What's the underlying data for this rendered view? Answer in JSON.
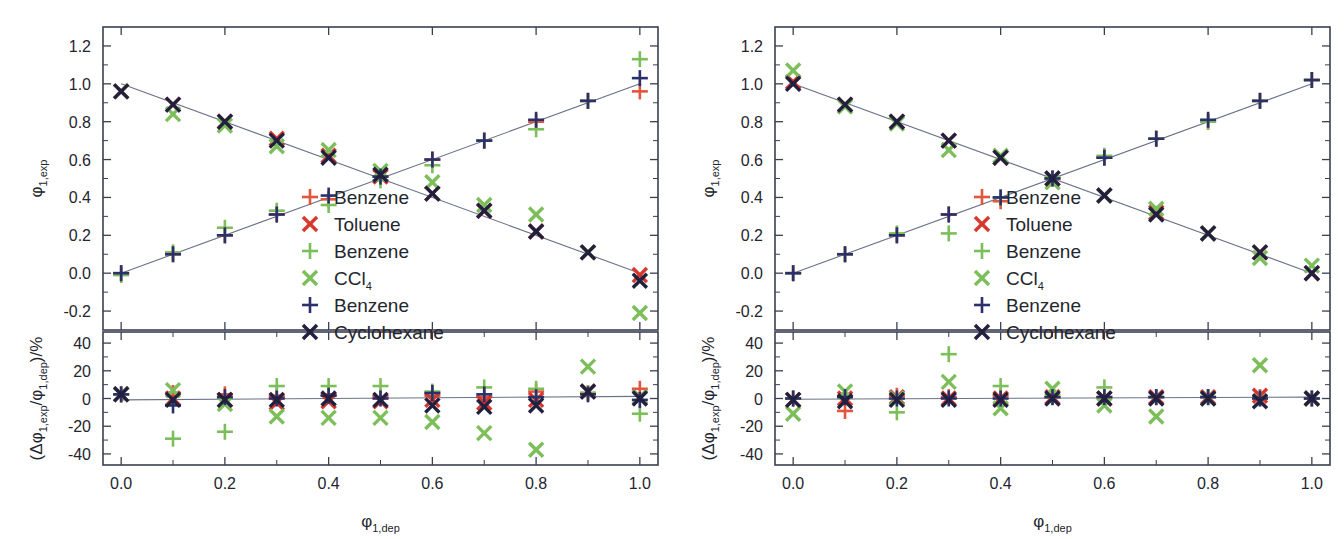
{
  "figure": {
    "panel_count": 2,
    "background": "#ffffff"
  },
  "axes": {
    "x_label_main": "φ",
    "x_label_sub": "1,dep",
    "y_top_label_main": "φ",
    "y_top_label_sub": "1,exp",
    "y_bottom_label": "(Δφ",
    "y_bottom_sub1": "1,exp",
    "y_bottom_mid": "/φ",
    "y_bottom_sub2": "1,dep",
    "y_bottom_end": ")/%",
    "x_ticks": [
      "0.0",
      "0.2",
      "0.4",
      "0.6",
      "0.8",
      "1.0"
    ],
    "y_top_ticks": [
      "1.2",
      "1.0",
      "0.8",
      "0.6",
      "0.4",
      "0.2",
      "0.0",
      "-0.2"
    ],
    "y_bottom_ticks": [
      "40",
      "20",
      "0",
      "-20",
      "-40"
    ]
  },
  "legend": {
    "entries": [
      {
        "label": "Benzene",
        "marker": "plus",
        "color": "#e2563c",
        "name": "legend-benzene-red"
      },
      {
        "label": "Toluene",
        "marker": "cross",
        "color": "#d8372b",
        "name": "legend-toluene"
      },
      {
        "label": "Benzene",
        "marker": "plus",
        "color": "#7cbf5a",
        "name": "legend-benzene-green"
      },
      {
        "label": "CCl",
        "sub": "4",
        "marker": "cross",
        "color": "#7cbf5a",
        "name": "legend-ccl4"
      },
      {
        "label": "Benzene",
        "marker": "plus",
        "color": "#2b2f6b",
        "name": "legend-benzene-navy"
      },
      {
        "label": "Cyclohexane",
        "marker": "cross",
        "color": "#21203f",
        "name": "legend-cyclohexane"
      }
    ]
  },
  "colors": {
    "red_plus": "#e2563c",
    "red_cross": "#d8372b",
    "green": "#7cbf5a",
    "navy_plus": "#2b2f6b",
    "navy_cross": "#21203f",
    "frame": "#3a3f52",
    "fitline": "#6a7188"
  },
  "chart_data": {
    "type": "scatter",
    "title": "",
    "xlabel": "φ 1,dep",
    "ylabel_top": "φ 1,exp",
    "ylabel_bottom": "(Δφ 1,exp / φ 1,dep) / %",
    "xlim": [
      -0.035,
      1.035
    ],
    "ylim_top": [
      -0.3,
      1.3
    ],
    "ylim_bottom": [
      -48,
      48
    ],
    "grid": false,
    "legend_position": "center-right-inside",
    "panels": [
      {
        "name": "left-panel",
        "x": [
          0.0,
          0.1,
          0.2,
          0.3,
          0.4,
          0.5,
          0.6,
          0.7,
          0.8,
          0.9,
          1.0
        ],
        "top": {
          "fit_lines": [
            {
              "name": "rising",
              "from": [
                0.0,
                0.0
              ],
              "to": [
                1.0,
                1.0
              ]
            },
            {
              "name": "falling",
              "from": [
                0.0,
                1.0
              ],
              "to": [
                1.0,
                0.0
              ]
            }
          ],
          "series": [
            {
              "name": "Benzene-red-plus",
              "marker": "plus",
              "color": "#e2563c",
              "values": [
                0.0,
                0.1,
                0.2,
                0.31,
                0.39,
                0.51,
                0.6,
                0.7,
                0.8,
                0.91,
                0.96
              ]
            },
            {
              "name": "Toluene-red-cross",
              "marker": "cross",
              "color": "#d8372b",
              "values": [
                0.96,
                0.89,
                0.8,
                0.71,
                0.62,
                0.51,
                0.42,
                0.33,
                0.22,
                0.11,
                -0.01
              ]
            },
            {
              "name": "Benzene-green-plus",
              "marker": "plus",
              "color": "#7cbf5a",
              "values": [
                -0.01,
                0.11,
                0.24,
                0.33,
                0.36,
                0.49,
                0.57,
                0.7,
                0.76,
                0.91,
                1.13
              ]
            },
            {
              "name": "CCl4-green-cross",
              "marker": "cross",
              "color": "#7cbf5a",
              "values": [
                0.96,
                0.84,
                0.78,
                0.67,
                0.65,
                0.54,
                0.48,
                0.36,
                0.31,
                0.11,
                -0.21
              ]
            },
            {
              "name": "Benzene-navy-plus",
              "marker": "plus",
              "color": "#2b2f6b",
              "values": [
                0.0,
                0.1,
                0.2,
                0.31,
                0.41,
                0.51,
                0.6,
                0.7,
                0.81,
                0.91,
                1.03
              ]
            },
            {
              "name": "Cyclohexane-navy-cross",
              "marker": "cross",
              "color": "#21203f",
              "values": [
                0.96,
                0.89,
                0.8,
                0.7,
                0.61,
                0.52,
                0.42,
                0.33,
                0.22,
                0.11,
                -0.04
              ]
            }
          ]
        },
        "bottom": {
          "baseline": {
            "from": [
              0.0,
              -1.0
            ],
            "to": [
              1.0,
              1.5
            ]
          },
          "series": [
            {
              "name": "Benzene-red-plus",
              "marker": "plus",
              "color": "#e2563c",
              "values": [
                3.0,
                4.0,
                3.0,
                2.0,
                3.0,
                1.0,
                2.0,
                1.0,
                5.0,
                4.0,
                7.0
              ]
            },
            {
              "name": "Toluene-red-cross",
              "marker": "cross",
              "color": "#d8372b",
              "values": [
                3.0,
                0.0,
                -1.0,
                -3.0,
                -2.0,
                -2.0,
                -1.0,
                -3.0,
                -1.0,
                5.0,
                1.0
              ]
            },
            {
              "name": "Benzene-green-plus",
              "marker": "plus",
              "color": "#7cbf5a",
              "values": [
                3.0,
                -29.0,
                -24.0,
                9.0,
                9.0,
                9.0,
                5.0,
                8.0,
                7.0,
                4.0,
                -11.0
              ]
            },
            {
              "name": "CCl4-green-cross",
              "marker": "cross",
              "color": "#7cbf5a",
              "values": [
                3.0,
                6.0,
                -4.0,
                -13.0,
                -14.0,
                -14.0,
                -17.0,
                -25.0,
                -37.0,
                23.0,
                1.0
              ]
            },
            {
              "name": "Benzene-navy-plus",
              "marker": "plus",
              "color": "#2b2f6b",
              "values": [
                3.0,
                -5.0,
                1.0,
                0.0,
                2.0,
                0.0,
                4.0,
                3.0,
                1.0,
                3.0,
                -1.0
              ]
            },
            {
              "name": "Cyclohexane-navy-cross",
              "marker": "cross",
              "color": "#21203f",
              "values": [
                3.0,
                -1.0,
                -1.0,
                -1.0,
                0.0,
                -1.0,
                -5.0,
                -6.0,
                -5.0,
                5.0,
                0.0
              ]
            }
          ]
        }
      },
      {
        "name": "right-panel",
        "x": [
          0.0,
          0.1,
          0.2,
          0.3,
          0.4,
          0.5,
          0.6,
          0.7,
          0.8,
          0.9,
          1.0
        ],
        "top": {
          "fit_lines": [
            {
              "name": "rising",
              "from": [
                0.0,
                0.0
              ],
              "to": [
                1.0,
                1.0
              ]
            },
            {
              "name": "falling",
              "from": [
                0.0,
                1.0
              ],
              "to": [
                1.0,
                0.0
              ]
            }
          ],
          "series": [
            {
              "name": "Benzene-red-plus",
              "marker": "plus",
              "color": "#e2563c",
              "values": [
                0.0,
                0.1,
                0.2,
                0.31,
                0.38,
                0.5,
                0.61,
                0.71,
                0.8,
                0.91,
                1.02
              ]
            },
            {
              "name": "Toluene-red-cross",
              "marker": "cross",
              "color": "#d8372b",
              "values": [
                1.01,
                0.89,
                0.8,
                0.7,
                0.61,
                0.5,
                0.41,
                0.32,
                0.21,
                0.11,
                0.0
              ]
            },
            {
              "name": "Benzene-green-plus",
              "marker": "plus",
              "color": "#7cbf5a",
              "values": [
                0.0,
                0.1,
                0.21,
                0.21,
                0.4,
                0.5,
                0.62,
                0.71,
                0.8,
                0.91,
                1.02
              ]
            },
            {
              "name": "CCl4-green-cross",
              "marker": "cross",
              "color": "#7cbf5a",
              "values": [
                1.07,
                0.88,
                0.79,
                0.65,
                0.62,
                0.48,
                0.41,
                0.34,
                0.21,
                0.08,
                0.04
              ]
            },
            {
              "name": "Benzene-navy-plus",
              "marker": "plus",
              "color": "#2b2f6b",
              "values": [
                0.0,
                0.1,
                0.2,
                0.31,
                0.4,
                0.5,
                0.61,
                0.71,
                0.81,
                0.91,
                1.02
              ]
            },
            {
              "name": "Cyclohexane-navy-cross",
              "marker": "cross",
              "color": "#21203f",
              "values": [
                1.0,
                0.89,
                0.8,
                0.7,
                0.61,
                0.5,
                0.41,
                0.31,
                0.21,
                0.11,
                0.0
              ]
            }
          ]
        },
        "bottom": {
          "baseline": {
            "from": [
              0.0,
              -0.5
            ],
            "to": [
              1.0,
              1.0
            ]
          },
          "series": [
            {
              "name": "Benzene-red-plus",
              "marker": "plus",
              "color": "#e2563c",
              "values": [
                0.0,
                -9.0,
                2.0,
                1.0,
                2.0,
                1.0,
                1.0,
                1.0,
                1.0,
                1.0,
                0.0
              ]
            },
            {
              "name": "Toluene-red-cross",
              "marker": "cross",
              "color": "#d8372b",
              "values": [
                -1.0,
                0.0,
                1.0,
                0.0,
                0.0,
                1.0,
                0.0,
                1.0,
                1.0,
                2.0,
                0.0
              ]
            },
            {
              "name": "Benzene-green-plus",
              "marker": "plus",
              "color": "#7cbf5a",
              "values": [
                0.0,
                1.0,
                -10.0,
                32.0,
                9.0,
                1.0,
                8.0,
                1.0,
                1.0,
                0.0,
                0.0
              ]
            },
            {
              "name": "CCl4-green-cross",
              "marker": "cross",
              "color": "#7cbf5a",
              "values": [
                -11.0,
                5.0,
                0.0,
                12.0,
                -7.0,
                7.0,
                -5.0,
                -13.0,
                0.0,
                24.0,
                0.0
              ]
            },
            {
              "name": "Benzene-navy-plus",
              "marker": "plus",
              "color": "#2b2f6b",
              "values": [
                0.0,
                1.0,
                0.0,
                0.0,
                0.0,
                1.0,
                1.0,
                1.0,
                1.0,
                0.0,
                0.0
              ]
            },
            {
              "name": "Cyclohexane-navy-cross",
              "marker": "cross",
              "color": "#21203f",
              "values": [
                -1.0,
                -2.0,
                -1.0,
                -1.0,
                -1.0,
                0.0,
                0.0,
                0.0,
                0.0,
                -2.0,
                0.0
              ]
            }
          ]
        }
      }
    ]
  }
}
